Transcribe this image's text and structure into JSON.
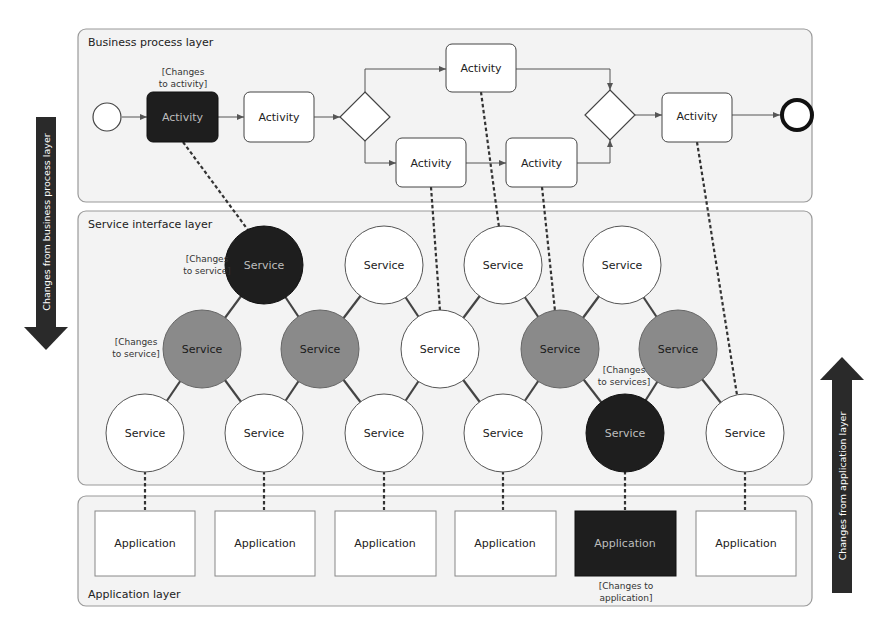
{
  "layers": {
    "business": {
      "label": "Business process layer"
    },
    "service": {
      "label": "Service interface layer"
    },
    "application": {
      "label": "Application layer"
    }
  },
  "side_arrows": {
    "left": {
      "label": "Changes from business process layer",
      "direction": "down"
    },
    "right": {
      "label": "Changes from application layer",
      "direction": "up"
    }
  },
  "activities": [
    {
      "id": "a1",
      "label": "Activity",
      "highlighted": true,
      "annotation": [
        "[Changes",
        "to activity]"
      ]
    },
    {
      "id": "a2",
      "label": "Activity",
      "highlighted": false
    },
    {
      "id": "a3",
      "label": "Activity",
      "highlighted": false
    },
    {
      "id": "a4",
      "label": "Activity",
      "highlighted": false
    },
    {
      "id": "a5",
      "label": "Activity",
      "highlighted": false
    },
    {
      "id": "a6",
      "label": "Activity",
      "highlighted": false
    }
  ],
  "services": [
    {
      "id": "s1",
      "label": "Service",
      "state": "changed",
      "annotation": [
        "[Changes",
        "to service]"
      ]
    },
    {
      "id": "s2",
      "label": "Service",
      "state": "normal"
    },
    {
      "id": "s3",
      "label": "Service",
      "state": "normal"
    },
    {
      "id": "s4",
      "label": "Service",
      "state": "normal"
    },
    {
      "id": "s5",
      "label": "Service",
      "state": "affected",
      "annotation": [
        "[Changes",
        "to service]"
      ]
    },
    {
      "id": "s6",
      "label": "Service",
      "state": "affected"
    },
    {
      "id": "s7",
      "label": "Service",
      "state": "normal"
    },
    {
      "id": "s8",
      "label": "Service",
      "state": "affected"
    },
    {
      "id": "s9",
      "label": "Service",
      "state": "affected"
    },
    {
      "id": "s10",
      "label": "Service",
      "state": "normal"
    },
    {
      "id": "s11",
      "label": "Service",
      "state": "normal"
    },
    {
      "id": "s12",
      "label": "Service",
      "state": "normal"
    },
    {
      "id": "s13",
      "label": "Service",
      "state": "normal"
    },
    {
      "id": "s14",
      "label": "Service",
      "state": "changed",
      "annotation": [
        "[Changes",
        "to services]"
      ]
    },
    {
      "id": "s15",
      "label": "Service",
      "state": "normal"
    }
  ],
  "applications": [
    {
      "id": "app1",
      "label": "Application",
      "highlighted": false
    },
    {
      "id": "app2",
      "label": "Application",
      "highlighted": false
    },
    {
      "id": "app3",
      "label": "Application",
      "highlighted": false
    },
    {
      "id": "app4",
      "label": "Application",
      "highlighted": false
    },
    {
      "id": "app5",
      "label": "Application",
      "highlighted": true,
      "annotation": [
        "[Changes to",
        "application]"
      ]
    },
    {
      "id": "app6",
      "label": "Application",
      "highlighted": false
    }
  ],
  "colors": {
    "changed": "#1e1e1e",
    "affected": "#8a8a8a",
    "normal": "#ffffff",
    "layer_bg": "#f3f3f3",
    "layer_border": "#9a9a9a",
    "arrow": "#2a2a2a"
  }
}
